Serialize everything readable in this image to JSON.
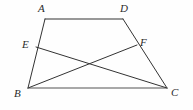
{
  "figure": {
    "kind": "plane-geometry-diagram",
    "shape": "trapezoid-with-crossing-cevians",
    "canvas": {
      "width": 193,
      "height": 110
    },
    "background_color": "#fefefe",
    "stroke_color": "#333333",
    "baseline_color": "#8c8c8c",
    "stroke_width": 1,
    "baseline_width": 1.4,
    "points": [
      {
        "id": "A",
        "label": "A",
        "x": 45,
        "y": 19,
        "label_x": 38,
        "label_y": 3
      },
      {
        "id": "D",
        "label": "D",
        "x": 123,
        "y": 19,
        "label_x": 120,
        "label_y": 3
      },
      {
        "id": "E",
        "label": "E",
        "x": 36,
        "y": 47,
        "label_x": 22,
        "label_y": 39
      },
      {
        "id": "F",
        "label": "F",
        "x": 137,
        "y": 45,
        "label_x": 140,
        "label_y": 37
      },
      {
        "id": "B",
        "label": "B",
        "x": 28,
        "y": 88,
        "label_x": 14,
        "label_y": 88
      },
      {
        "id": "C",
        "label": "C",
        "x": 167,
        "y": 88,
        "label_x": 171,
        "label_y": 87
      }
    ],
    "segments": [
      {
        "id": "AD",
        "from": "A",
        "to": "D",
        "role": "top-side",
        "color": "#333333",
        "width": 1
      },
      {
        "id": "AB",
        "from": "A",
        "to": "B",
        "role": "left-leg",
        "color": "#333333",
        "width": 1
      },
      {
        "id": "DC",
        "from": "D",
        "to": "C",
        "role": "right-leg",
        "color": "#333333",
        "width": 1
      },
      {
        "id": "BC",
        "from": "B",
        "to": "C",
        "role": "bottom-side",
        "color": "#8c8c8c",
        "width": 1.4
      },
      {
        "id": "EC",
        "from": "E",
        "to": "C",
        "role": "diagonal",
        "color": "#333333",
        "width": 1
      },
      {
        "id": "BF",
        "from": "B",
        "to": "F",
        "role": "diagonal",
        "color": "#333333",
        "width": 1
      }
    ]
  }
}
